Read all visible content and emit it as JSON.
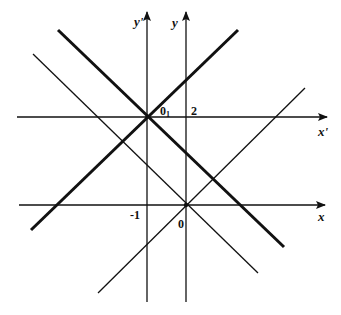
{
  "diagram": {
    "type": "coordinate-translation",
    "axes": {
      "x_label": "x",
      "y_label": "y",
      "x_prime_label": "x'",
      "y_prime_label": "y'"
    },
    "points": {
      "origin_label": "0",
      "new_origin_label": "0",
      "new_origin_subscript": "1"
    },
    "tick_labels": {
      "x_tick": "-1",
      "y_tick": "2"
    },
    "colors": {
      "line": "#111111",
      "background": "#ffffff"
    },
    "lines": [
      {
        "name": "thick-descending-line",
        "from": [
          58,
          30
        ],
        "to": [
          284,
          247
        ],
        "weight": "thick"
      },
      {
        "name": "thick-ascending-line",
        "from": [
          31,
          230
        ],
        "to": [
          238,
          30
        ],
        "weight": "thick"
      },
      {
        "name": "thin-descending-line",
        "from": [
          33,
          54
        ],
        "to": [
          258,
          273
        ],
        "weight": "thin"
      },
      {
        "name": "thin-ascending-line",
        "from": [
          98,
          293
        ],
        "to": [
          305,
          88
        ],
        "weight": "thin"
      }
    ]
  }
}
